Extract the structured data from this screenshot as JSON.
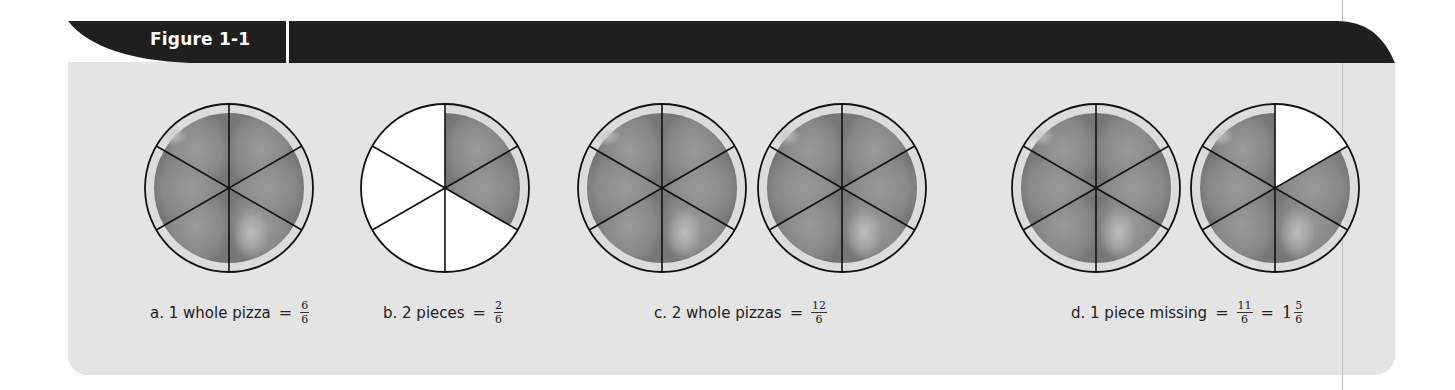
{
  "figure": {
    "title": "Figure 1-1",
    "header_color": "#1f1f1f",
    "panel_color": "#e4e4e4"
  },
  "pizza_style": {
    "sauce_color": "#8a8a8a",
    "crust_color": "#dcdcdc",
    "empty_color": "#ffffff",
    "outline_color": "#111111",
    "slices_per_pizza": 6
  },
  "items": [
    {
      "id": "a",
      "caption": "a. 1 whole pizza",
      "equals": "=",
      "fraction": {
        "num": "6",
        "den": "6"
      },
      "pizzas": [
        {
          "cx": 229,
          "cy": 188,
          "filled_slices": [
            true,
            true,
            true,
            true,
            true,
            true
          ]
        }
      ]
    },
    {
      "id": "b",
      "caption": "b. 2 pieces",
      "equals": "=",
      "fraction": {
        "num": "2",
        "den": "6"
      },
      "pizzas": [
        {
          "cx": 445,
          "cy": 188,
          "filled_slices": [
            true,
            true,
            false,
            false,
            false,
            false
          ]
        }
      ]
    },
    {
      "id": "c",
      "caption": "c. 2 whole pizzas",
      "equals": "=",
      "fraction": {
        "num": "12",
        "den": "6"
      },
      "pizzas": [
        {
          "cx": 662,
          "cy": 188,
          "filled_slices": [
            true,
            true,
            true,
            true,
            true,
            true
          ]
        },
        {
          "cx": 842,
          "cy": 188,
          "filled_slices": [
            true,
            true,
            true,
            true,
            true,
            true
          ]
        }
      ]
    },
    {
      "id": "d",
      "caption": "d. 1 piece missing",
      "equals": "=",
      "fraction": {
        "num": "11",
        "den": "6"
      },
      "equals2": "=",
      "mixed": {
        "whole": "1",
        "num": "5",
        "den": "6"
      },
      "pizzas": [
        {
          "cx": 1096,
          "cy": 188,
          "filled_slices": [
            true,
            true,
            true,
            true,
            true,
            true
          ]
        },
        {
          "cx": 1275,
          "cy": 188,
          "filled_slices": [
            false,
            true,
            true,
            true,
            true,
            true
          ]
        }
      ]
    }
  ]
}
